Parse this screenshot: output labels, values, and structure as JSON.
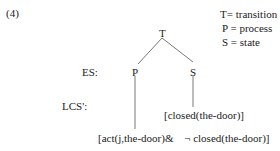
{
  "example_number": "(4)",
  "legend": [
    "T= transition",
    "P = process",
    "S = state"
  ],
  "tree": {
    "root": "T",
    "left": "P",
    "right": "S"
  },
  "row_labels": {
    "es": "ES:",
    "lcs": "LCS':"
  },
  "lcs": {
    "state": "[closed(the-door)]",
    "process": "[act(j,the-door)&",
    "negation_symbol": "¬",
    "process_tail": "closed(the-door)]"
  }
}
